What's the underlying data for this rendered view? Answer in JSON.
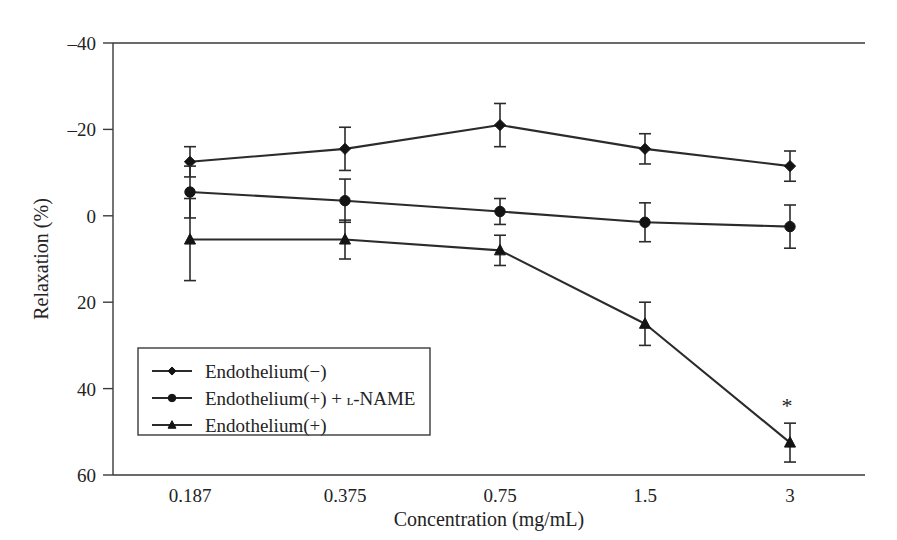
{
  "figure": {
    "title": "",
    "background_color": "#ffffff",
    "ink_color": "#2b2b2b"
  },
  "axes": {
    "y_title": "Relaxation (%)",
    "x_title": "Concentration (mg/mL)",
    "y_ticks": [
      "–40",
      "–20",
      "0",
      "20",
      "40",
      "60"
    ],
    "x_ticks": [
      "0.187",
      "0.375",
      "0.75",
      "1.5",
      "3"
    ]
  },
  "legend": {
    "items": [
      {
        "label": "Endothelium(−)",
        "marker": "diamond-marker"
      },
      {
        "label_pre": "Endothelium(+) + ",
        "label_sc": "ʟ",
        "label_post": "-NAME",
        "marker": "circle-marker"
      },
      {
        "label": "Endothelium(+)",
        "marker": "triangle-marker"
      }
    ]
  },
  "annotations": [
    {
      "text": "*",
      "series": "Endothelium(+)",
      "category": "3"
    }
  ],
  "chart_data": {
    "type": "line",
    "title": "",
    "xlabel": "Concentration (mg/mL)",
    "ylabel": "Relaxation (%)",
    "categories": [
      "0.187",
      "0.375",
      "0.75",
      "1.5",
      "3"
    ],
    "ylim": [
      -40,
      60
    ],
    "y_inverted": true,
    "y_ticks": [
      -40,
      -20,
      0,
      20,
      40,
      60
    ],
    "grid": false,
    "legend_position": "inside-lower-left",
    "error_bar_type": "SEM",
    "series": [
      {
        "name": "Endothelium(−)",
        "marker": "diamond",
        "values": [
          -12.5,
          -15.5,
          -21.0,
          -15.5,
          -11.5
        ],
        "errors": [
          3.5,
          5.0,
          5.0,
          3.5,
          3.5
        ]
      },
      {
        "name": "Endothelium(+) + ʟ-NAME",
        "marker": "circle",
        "values": [
          -5.5,
          -3.5,
          -1.0,
          1.5,
          2.5
        ],
        "errors": [
          6.0,
          5.0,
          3.0,
          4.5,
          5.0
        ]
      },
      {
        "name": "Endothelium(+)",
        "marker": "triangle",
        "values": [
          5.5,
          5.5,
          8.0,
          25.0,
          52.5
        ],
        "errors": [
          9.5,
          4.5,
          3.5,
          5.0,
          4.5
        ]
      }
    ],
    "significance_markers": [
      {
        "series": "Endothelium(+)",
        "category": "3",
        "symbol": "*"
      }
    ]
  }
}
